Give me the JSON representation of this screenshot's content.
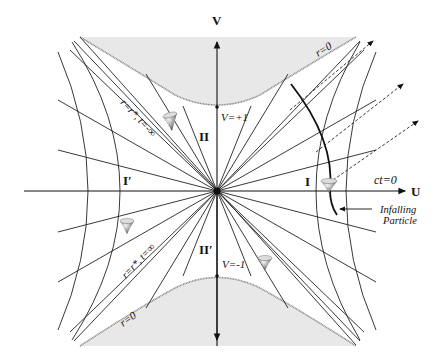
{
  "diagram": {
    "axes": {
      "vertical_label": "V",
      "horizontal_label": "U",
      "ct_label": "ct=0"
    },
    "regions": {
      "region_I": "I",
      "region_I_prime": "I′",
      "region_II": "II",
      "region_II_prime": "II′"
    },
    "boundary_labels": {
      "future_singularity": "r=0",
      "past_singularity": "r=0",
      "V_plus": "V=+1",
      "V_minus": "V=-1",
      "horizon_future": "r=r*, t=-∞",
      "horizon_past": "r=r*, t=∞"
    },
    "annotation": {
      "line1": "Infalling",
      "line2": "Particle"
    },
    "colors": {
      "singularity_fill": "#e8e8e8",
      "singularity_edge": "#888888",
      "lines": "#222222"
    }
  }
}
